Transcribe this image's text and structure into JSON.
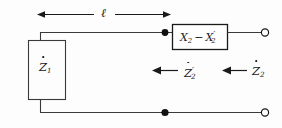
{
  "figure": {
    "kind": "circuit-diagram",
    "width": 282,
    "height": 128,
    "background_color": "#fdfdfd",
    "stroke_color": "#1a1a1a",
    "labels": {
      "length": "ℓ",
      "left_impedance_symbol": "Z",
      "left_impedance_subscript": "1",
      "series_element_first": "X",
      "series_element_first_subscript": "2",
      "series_element_operator": "−",
      "series_element_second": "X",
      "series_element_second_subscript": "2",
      "series_element_second_prime": "′",
      "z2_prime_symbol": "Z",
      "z2_prime_subscript": "2",
      "z2_prime_mark": "′",
      "z2_symbol": "Z",
      "z2_subscript": "2"
    },
    "annotations": {
      "length_arrow": "double-headed horizontal dimension arrow spanning the line length",
      "z2_prime_arrow": "left-pointing arrow indicating impedance looking left of the series element",
      "z2_arrow": "left-pointing arrow indicating impedance looking in from the right terminals"
    },
    "nodes": {
      "top_junction_dot": "filled",
      "bottom_junction_dot": "filled",
      "top_right_terminal": "open",
      "bottom_right_terminal": "open"
    }
  }
}
